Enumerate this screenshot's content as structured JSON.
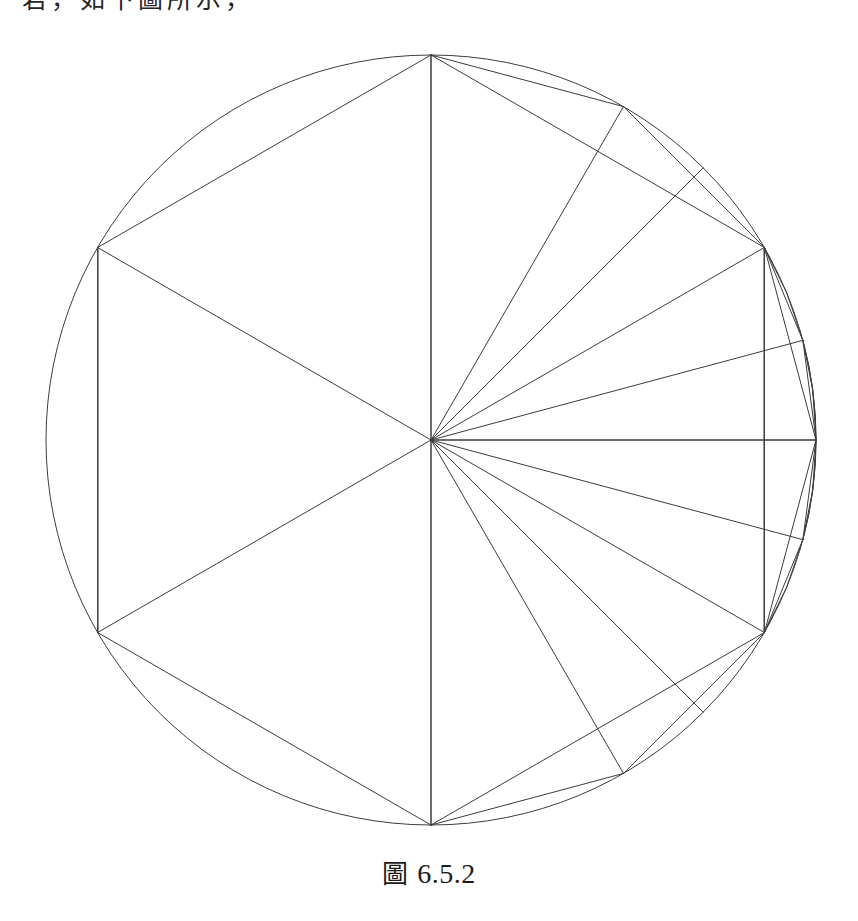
{
  "page": {
    "background_color": "#ffffff",
    "width": 858,
    "height": 921,
    "top_running_text": "若，如下圖所示，"
  },
  "caption": {
    "label_zh": "圖",
    "number": "6.5.2",
    "full": "圖 6.5.2"
  },
  "figure": {
    "stroke_color": "#3c3c3c",
    "stroke_width": 1,
    "fill": "none",
    "center": {
      "x": 431,
      "y": 412
    },
    "radius": 385,
    "circle": {
      "cx": 431,
      "cy": 412,
      "r": 385
    },
    "hexagon": {
      "sides": 6,
      "vertex_angles_deg": [
        30,
        90,
        150,
        210,
        270,
        330
      ],
      "vertices": [
        {
          "x": 764,
          "y": 219,
          "angle_deg": 30
        },
        {
          "x": 431,
          "y": 27,
          "angle_deg": 90
        },
        {
          "x": 98,
          "y": 219,
          "angle_deg": 150
        },
        {
          "x": 98,
          "y": 605,
          "angle_deg": 210
        },
        {
          "x": 431,
          "y": 797,
          "angle_deg": 270
        },
        {
          "x": 764,
          "y": 605,
          "angle_deg": 330
        }
      ]
    },
    "subdivisions": [
      {
        "name": "12-gon",
        "step_deg": 30,
        "sector_range_deg": [
          -90,
          90
        ]
      },
      {
        "name": "24-gon",
        "step_deg": 15,
        "sector_range_deg": [
          -30,
          30
        ]
      },
      {
        "name": "48-gon",
        "step_deg": 7.5,
        "sector_range_deg": [
          -30,
          30
        ]
      },
      {
        "name": "96-gon",
        "step_deg": 3.75,
        "sector_range_deg": [
          -15,
          15
        ]
      }
    ],
    "radii_angles_deg": [
      0,
      15,
      30,
      45,
      60,
      90,
      150,
      210,
      270,
      330,
      345,
      315,
      300
    ],
    "vertical_diameter": {
      "x1": 431,
      "y1": 27,
      "x2": 431,
      "y2": 797
    },
    "horizontal_radius": {
      "x1": 431,
      "y1": 412,
      "x2": 816,
      "y2": 412
    },
    "left_chord": {
      "x1": 98,
      "y1": 219,
      "x2": 98,
      "y2": 605
    },
    "right_chord": {
      "x1": 764,
      "y1": 219,
      "x2": 764,
      "y2": 605
    }
  }
}
